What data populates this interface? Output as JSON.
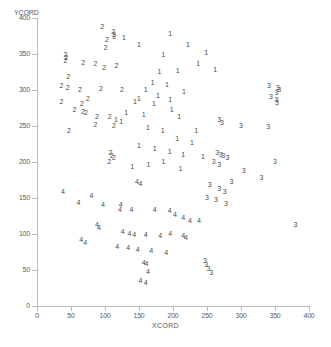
{
  "chart_data": {
    "type": "scatter",
    "title": "",
    "xlabel": "XCORD",
    "ylabel": "YCORD",
    "xlim": [
      0,
      400
    ],
    "ylim": [
      0,
      400
    ],
    "xticks": [
      0,
      50,
      100,
      150,
      200,
      250,
      300,
      350,
      400
    ],
    "yticks": [
      0,
      50,
      100,
      150,
      200,
      250,
      300,
      350,
      400
    ],
    "grid": false,
    "legend": "none",
    "marker_style": "cluster-number-glyph",
    "series": [
      {
        "name": "1",
        "label": "1",
        "points": [
          [
            128,
            372
          ],
          [
            150,
            362
          ],
          [
            196,
            378
          ],
          [
            222,
            363
          ],
          [
            249,
            352
          ],
          [
            186,
            348
          ],
          [
            237,
            336
          ],
          [
            262,
            328
          ],
          [
            180,
            325
          ],
          [
            207,
            327
          ],
          [
            170,
            310
          ],
          [
            191,
            307
          ],
          [
            160,
            300
          ],
          [
            216,
            297
          ],
          [
            178,
            292
          ],
          [
            150,
            288
          ],
          [
            196,
            286
          ],
          [
            144,
            283
          ],
          [
            172,
            280
          ],
          [
            198,
            272
          ],
          [
            131,
            268
          ],
          [
            157,
            265
          ],
          [
            209,
            263
          ],
          [
            116,
            258
          ],
          [
            124,
            255
          ],
          [
            163,
            247
          ],
          [
            185,
            243
          ],
          [
            234,
            243
          ],
          [
            206,
            232
          ],
          [
            228,
            227
          ],
          [
            150,
            222
          ],
          [
            173,
            218
          ],
          [
            195,
            214
          ],
          [
            215,
            210
          ],
          [
            244,
            207
          ],
          [
            186,
            200
          ],
          [
            164,
            196
          ],
          [
            140,
            193
          ],
          [
            211,
            190
          ]
        ]
      },
      {
        "name": "2",
        "label": "2",
        "points": [
          [
            96,
            388
          ],
          [
            112,
            381
          ],
          [
            113,
            377
          ],
          [
            114,
            374
          ],
          [
            103,
            370
          ],
          [
            101,
            358
          ],
          [
            42,
            348
          ],
          [
            43,
            344
          ],
          [
            42,
            340
          ],
          [
            68,
            338
          ],
          [
            86,
            336
          ],
          [
            117,
            333
          ],
          [
            99,
            330
          ],
          [
            46,
            318
          ],
          [
            36,
            305
          ],
          [
            45,
            303
          ],
          [
            63,
            300
          ],
          [
            94,
            302
          ],
          [
            125,
            300
          ],
          [
            75,
            288
          ],
          [
            36,
            283
          ],
          [
            66,
            281
          ],
          [
            55,
            272
          ],
          [
            68,
            270
          ],
          [
            72,
            268
          ],
          [
            88,
            262
          ],
          [
            107,
            263
          ],
          [
            86,
            252
          ],
          [
            113,
            250
          ],
          [
            47,
            243
          ],
          [
            108,
            212
          ],
          [
            110,
            208
          ],
          [
            113,
            205
          ],
          [
            106,
            200
          ]
        ]
      },
      {
        "name": "3",
        "label": "3",
        "points": [
          [
            341,
            306
          ],
          [
            354,
            303
          ],
          [
            356,
            300
          ],
          [
            352,
            296
          ],
          [
            344,
            290
          ],
          [
            352,
            286
          ],
          [
            353,
            282
          ],
          [
            268,
            258
          ],
          [
            272,
            254
          ],
          [
            300,
            250
          ],
          [
            340,
            248
          ],
          [
            265,
            213
          ],
          [
            270,
            210
          ],
          [
            274,
            208
          ],
          [
            280,
            206
          ],
          [
            260,
            200
          ],
          [
            268,
            196
          ],
          [
            350,
            200
          ],
          [
            304,
            188
          ],
          [
            330,
            178
          ],
          [
            286,
            172
          ],
          [
            254,
            168
          ],
          [
            268,
            162
          ],
          [
            276,
            158
          ],
          [
            250,
            150
          ],
          [
            263,
            147
          ],
          [
            278,
            142
          ],
          [
            380,
            113
          ],
          [
            247,
            62
          ],
          [
            249,
            57
          ],
          [
            252,
            52
          ],
          [
            256,
            46
          ]
        ]
      },
      {
        "name": "4",
        "label": "4",
        "points": [
          [
            147,
            172
          ],
          [
            152,
            169
          ],
          [
            38,
            158
          ],
          [
            80,
            153
          ],
          [
            61,
            143
          ],
          [
            97,
            140
          ],
          [
            123,
            140
          ],
          [
            122,
            133
          ],
          [
            139,
            133
          ],
          [
            173,
            133
          ],
          [
            195,
            132
          ],
          [
            203,
            127
          ],
          [
            215,
            122
          ],
          [
            225,
            118
          ],
          [
            238,
            118
          ],
          [
            88,
            113
          ],
          [
            91,
            108
          ],
          [
            126,
            103
          ],
          [
            136,
            100
          ],
          [
            143,
            98
          ],
          [
            160,
            98
          ],
          [
            181,
            97
          ],
          [
            196,
            100
          ],
          [
            215,
            97
          ],
          [
            219,
            95
          ],
          [
            65,
            92
          ],
          [
            71,
            88
          ],
          [
            118,
            82
          ],
          [
            134,
            80
          ],
          [
            148,
            78
          ],
          [
            168,
            77
          ],
          [
            190,
            74
          ],
          [
            157,
            60
          ],
          [
            161,
            58
          ],
          [
            163,
            47
          ],
          [
            152,
            35
          ],
          [
            160,
            32
          ]
        ]
      }
    ]
  }
}
